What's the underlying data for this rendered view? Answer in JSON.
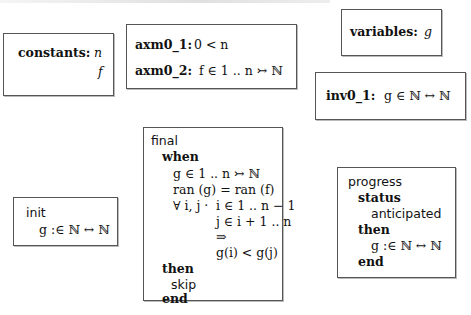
{
  "constants": {
    "label": "constants:",
    "items": [
      "n",
      "f"
    ]
  },
  "axioms": {
    "items": [
      {
        "label": "axm0_1:",
        "expr": "0 < n"
      },
      {
        "label": "axm0_2:",
        "expr": "f ∈ 1 .. n ↣ ℕ"
      }
    ]
  },
  "variables": {
    "label": "variables:",
    "items": [
      "g"
    ]
  },
  "invariants": {
    "items": [
      {
        "label": "inv0_1:",
        "expr": "g ∈ ℕ ↔ ℕ"
      }
    ]
  },
  "events": {
    "init": {
      "name": "init",
      "action": "g :∈ ℕ ↔ ℕ"
    },
    "final": {
      "name": "final",
      "when_kw": "when",
      "guards": [
        "g ∈ 1 .. n ↣ ℕ",
        "ran (g) = ran (f)",
        "∀ i, j ·",
        "i ∈ 1 .. n − 1",
        "j ∈ i + 1 .. n",
        "⇒",
        "g(i) < g(j)"
      ],
      "then_kw": "then",
      "action": "skip",
      "end_kw": "end"
    },
    "progress": {
      "name": "progress",
      "status_kw": "status",
      "status": "anticipated",
      "then_kw": "then",
      "action": "g :∈ ℕ ↔ ℕ",
      "end_kw": "end"
    }
  }
}
